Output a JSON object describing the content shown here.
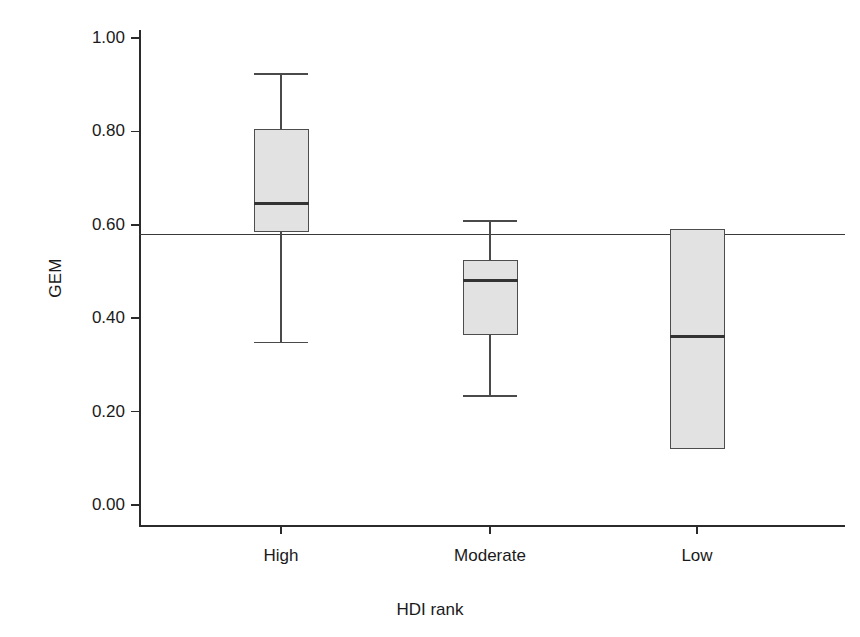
{
  "chart_data": {
    "type": "box",
    "title": "",
    "xlabel": "HDI rank",
    "ylabel": "GEM",
    "categories": [
      "High",
      "Moderate",
      "Low"
    ],
    "ylim": [
      0.0,
      1.0
    ],
    "yticks": [
      "0.00",
      "0.20",
      "0.40",
      "0.60",
      "0.80",
      "1.00"
    ],
    "ytick_values": [
      0.0,
      0.2,
      0.4,
      0.6,
      0.8,
      1.0
    ],
    "grid": false,
    "legend": "none",
    "reference_line": {
      "value": 0.58,
      "label": ""
    },
    "boxes": [
      {
        "category": "High",
        "whisker_low": 0.35,
        "q1": 0.585,
        "median": 0.645,
        "q3": 0.805,
        "whisker_high": 0.925,
        "has_whiskers": true
      },
      {
        "category": "Moderate",
        "whisker_low": 0.235,
        "q1": 0.365,
        "median": 0.48,
        "q3": 0.525,
        "whisker_high": 0.61,
        "has_whiskers": true
      },
      {
        "category": "Low",
        "whisker_low": null,
        "q1": 0.12,
        "median": 0.36,
        "q3": 0.59,
        "whisker_high": null,
        "has_whiskers": false
      }
    ],
    "colors": {
      "box_fill": "#e2e2e2",
      "box_edge": "#4d4d4d",
      "median": "#333333",
      "whisker": "#4a4a4a",
      "axis": "#2b2b2b",
      "reference_line": "#3a3a3a",
      "background": "#ffffff"
    }
  },
  "axis": {
    "y_title": "GEM",
    "x_title": "HDI rank",
    "y_tick_labels": [
      "1.00",
      "0.80",
      "0.60",
      "0.40",
      "0.20",
      "0.00"
    ],
    "x_tick_labels": [
      "High",
      "Moderate",
      "Low"
    ]
  }
}
